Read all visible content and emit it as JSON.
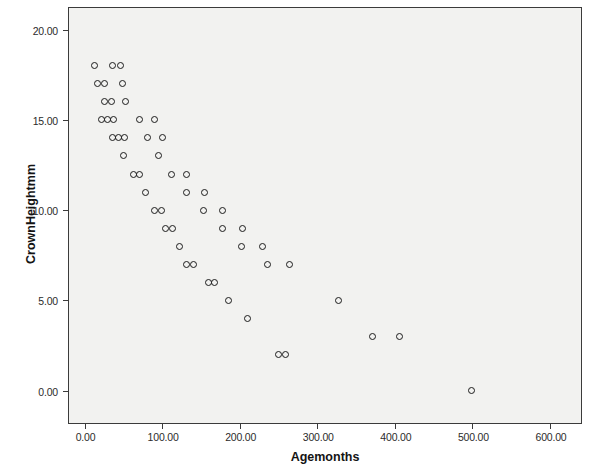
{
  "chart_data": {
    "type": "scatter",
    "title": "",
    "xlabel": "Agemonths",
    "ylabel": "CrownHeightmm",
    "xlim": [
      -20,
      640
    ],
    "ylim": [
      -1.8,
      21.2
    ],
    "xticks": [
      0,
      100,
      200,
      300,
      400,
      500,
      600
    ],
    "xticklabels": [
      "0.00",
      "100.00",
      "200.00",
      "300.00",
      "400.00",
      "500.00",
      "600.00"
    ],
    "yticks": [
      0,
      5,
      10,
      15,
      20
    ],
    "yticklabels": [
      "0.00",
      "5.00",
      "10.00",
      "15.00",
      "20.00"
    ],
    "grid": false,
    "legend": null,
    "marker": "open-circle",
    "marker_color": "#1c1c1c",
    "plot_background": "#f2f2f0",
    "points": [
      {
        "x": 13,
        "y": 18
      },
      {
        "x": 36,
        "y": 18
      },
      {
        "x": 46,
        "y": 18
      },
      {
        "x": 17,
        "y": 17
      },
      {
        "x": 26,
        "y": 17
      },
      {
        "x": 49,
        "y": 17
      },
      {
        "x": 26,
        "y": 16
      },
      {
        "x": 35,
        "y": 16
      },
      {
        "x": 53,
        "y": 16
      },
      {
        "x": 22,
        "y": 15
      },
      {
        "x": 30,
        "y": 15
      },
      {
        "x": 37,
        "y": 15
      },
      {
        "x": 71,
        "y": 15
      },
      {
        "x": 90,
        "y": 15
      },
      {
        "x": 36,
        "y": 14
      },
      {
        "x": 44,
        "y": 14
      },
      {
        "x": 51,
        "y": 14
      },
      {
        "x": 81,
        "y": 14
      },
      {
        "x": 101,
        "y": 14
      },
      {
        "x": 50,
        "y": 13
      },
      {
        "x": 95,
        "y": 13
      },
      {
        "x": 63,
        "y": 12
      },
      {
        "x": 71,
        "y": 12
      },
      {
        "x": 112,
        "y": 12
      },
      {
        "x": 132,
        "y": 12
      },
      {
        "x": 79,
        "y": 11
      },
      {
        "x": 132,
        "y": 11
      },
      {
        "x": 155,
        "y": 11
      },
      {
        "x": 90,
        "y": 10
      },
      {
        "x": 99,
        "y": 10
      },
      {
        "x": 153,
        "y": 10
      },
      {
        "x": 178,
        "y": 10
      },
      {
        "x": 104,
        "y": 9
      },
      {
        "x": 113,
        "y": 9
      },
      {
        "x": 178,
        "y": 9
      },
      {
        "x": 204,
        "y": 9
      },
      {
        "x": 122,
        "y": 8
      },
      {
        "x": 203,
        "y": 8
      },
      {
        "x": 229,
        "y": 8
      },
      {
        "x": 132,
        "y": 7
      },
      {
        "x": 141,
        "y": 7
      },
      {
        "x": 236,
        "y": 7
      },
      {
        "x": 264,
        "y": 7
      },
      {
        "x": 160,
        "y": 6
      },
      {
        "x": 168,
        "y": 6
      },
      {
        "x": 185,
        "y": 5
      },
      {
        "x": 327,
        "y": 5
      },
      {
        "x": 210,
        "y": 4
      },
      {
        "x": 371,
        "y": 3
      },
      {
        "x": 406,
        "y": 3
      },
      {
        "x": 250,
        "y": 2
      },
      {
        "x": 259,
        "y": 2
      },
      {
        "x": 499,
        "y": 0
      }
    ]
  }
}
